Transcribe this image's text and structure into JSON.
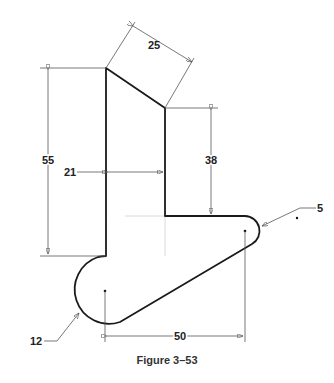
{
  "figure": {
    "caption": "Figure 3–53"
  },
  "dimensions": {
    "slant_width": "25",
    "left_height": "55",
    "right_height": "38",
    "neck_width": "21",
    "small_radius": "5",
    "large_radius": "12",
    "center_distance": "50"
  },
  "colors": {
    "outline": "#1a1a1a",
    "dimension": "#444444",
    "construction": "#cccccc"
  }
}
